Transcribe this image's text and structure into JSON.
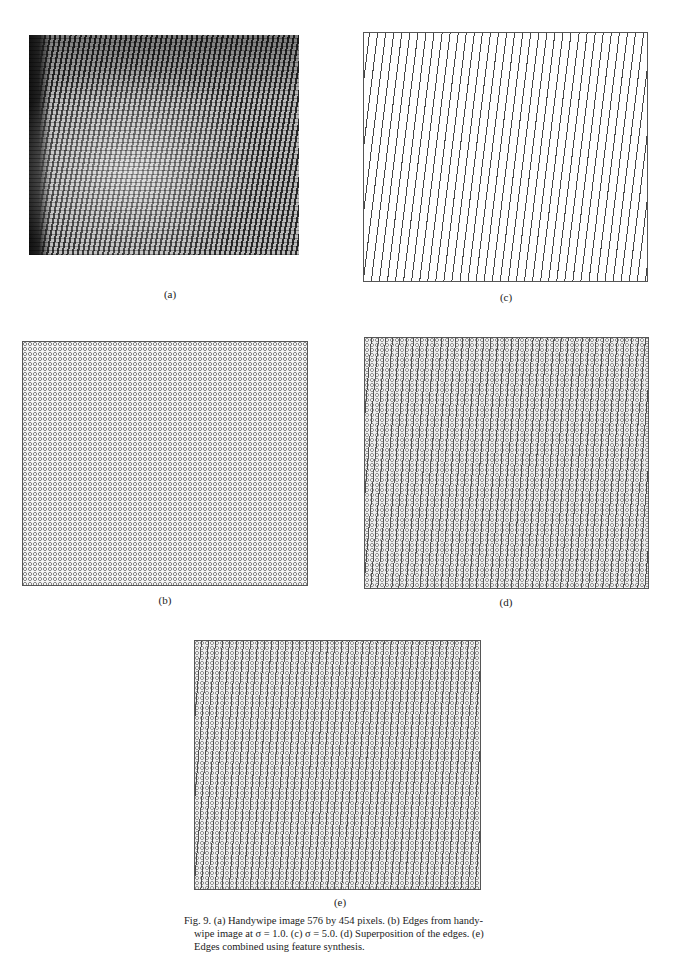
{
  "figure": {
    "number": "Fig. 9.",
    "panels": [
      {
        "id": "a",
        "label": "(a)",
        "description": "Handywipe image 576 by 454 pixels"
      },
      {
        "id": "b",
        "label": "(b)",
        "description": "Edges from handywipe image at σ = 1.0"
      },
      {
        "id": "c",
        "label": "(c)",
        "description": "σ = 5.0"
      },
      {
        "id": "d",
        "label": "(d)",
        "description": "Superposition of the edges"
      },
      {
        "id": "e",
        "label": "(e)",
        "description": "Edges combined using feature synthesis"
      }
    ],
    "caption_line1": "Fig. 9. (a) Handywipe image 576 by 454 pixels. (b) Edges from handy-",
    "caption_rest": "wipe image at σ = 1.0. (c) σ = 5.0. (d) Superposition of the edges. (e) Edges combined using feature synthesis."
  }
}
